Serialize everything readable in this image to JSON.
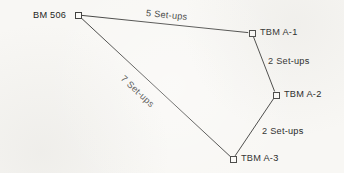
{
  "diagram": {
    "type": "survey-level-loop",
    "canvas": {
      "width": 344,
      "height": 173
    },
    "background_color": "#f8f7f4",
    "line_color": "#3a3a38",
    "text_color": "#1f1f1e",
    "nodes": [
      {
        "id": "bm-506",
        "label": "BM 506",
        "marker": "open-square",
        "x": 78,
        "y": 15,
        "label_side": "left"
      },
      {
        "id": "tbm-a-1",
        "label": "TBM A-1",
        "marker": "open-square",
        "x": 252,
        "y": 33,
        "label_side": "right"
      },
      {
        "id": "tbm-a-2",
        "label": "TBM A-2",
        "marker": "open-square",
        "x": 276,
        "y": 95,
        "label_side": "right"
      },
      {
        "id": "tbm-a-3",
        "label": "TBM A-3",
        "marker": "open-square",
        "x": 233,
        "y": 159,
        "label_side": "right"
      }
    ],
    "edges": [
      {
        "id": "edge-bm506-tbma1",
        "from": "bm-506",
        "to": "tbm-a-1",
        "label": "5 Set-ups",
        "setups": 5,
        "label_x": 146,
        "label_y": 8,
        "label_rotation": 5.5
      },
      {
        "id": "edge-tbma1-tbma2",
        "from": "tbm-a-1",
        "to": "tbm-a-2",
        "label": "2 Set-ups",
        "setups": 2,
        "label_x": 268,
        "label_y": 56,
        "label_rotation": 0
      },
      {
        "id": "edge-tbma2-tbma3",
        "from": "tbm-a-2",
        "to": "tbm-a-3",
        "label": "2 Set-ups",
        "setups": 2,
        "label_x": 262,
        "label_y": 126,
        "label_rotation": 0
      },
      {
        "id": "edge-tbma3-bm506",
        "from": "tbm-a-3",
        "to": "bm-506",
        "label": "7 Set-ups",
        "setups": 7,
        "label_x": 122,
        "label_y": 72,
        "label_rotation": 43
      }
    ],
    "total_setups": 16
  }
}
